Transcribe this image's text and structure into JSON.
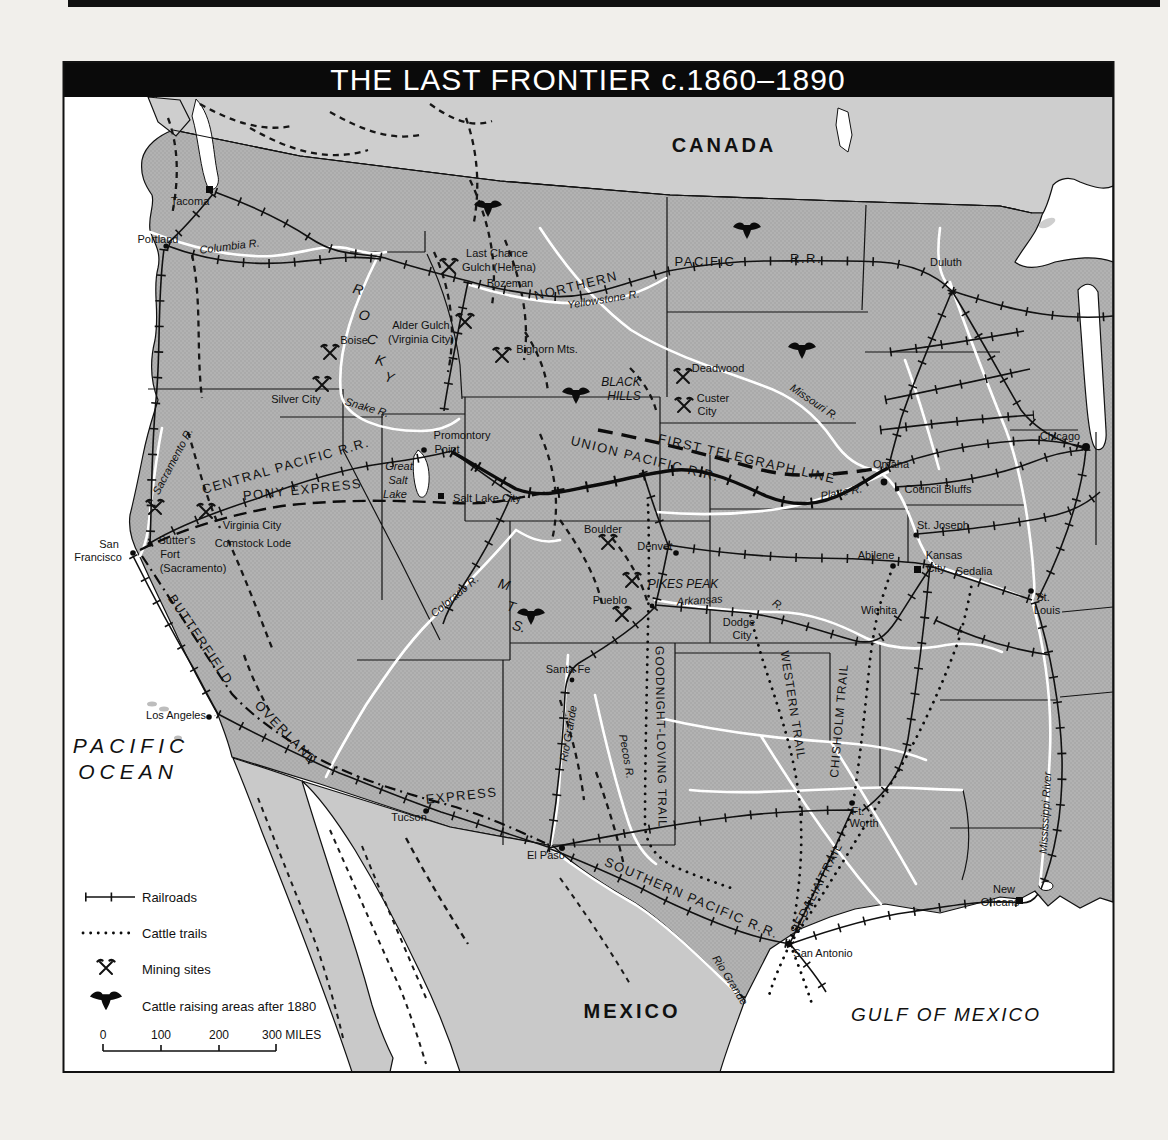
{
  "title": "THE LAST FRONTIER c.1860–1890",
  "regions": {
    "canada": "CANADA",
    "mexico": "MEXICO",
    "pacific_1": "PACIFIC",
    "pacific_2": "OCEAN",
    "gulf": "GULF OF MEXICO"
  },
  "railroads": {
    "northern": "NORTHERN",
    "pacific": "PACIFIC",
    "rr": "R.R.",
    "central_pacific": "CENTRAL PACIFIC R.R.",
    "union_pacific": "UNION PACIFIC R.R.",
    "southern_pacific": "SOUTHERN PACIFIC R.R."
  },
  "routes": {
    "pony_express": "PONY EXPRESS",
    "first_telegraph": "FIRST TELEGRAPH LINE",
    "butterfield": "BUTTERFIELD",
    "overland": "OVERLAND",
    "express": "EXPRESS"
  },
  "trails": {
    "goodnight": "GOODNIGHT-LOVING TRAIL",
    "western": "WESTERN TRAIL",
    "chisholm": "CHISHOLM TRAIL",
    "sedalia": "SEDALIA TRAIL"
  },
  "rivers": {
    "columbia": "Columbia R.",
    "yellowstone": "Yellowstone R.",
    "missouri": "Missouri R.",
    "platte": "Platte R.",
    "snake": "Snake R.",
    "sacramento": "Sacramento R.",
    "colorado": "Colorado R.",
    "arkansas": "Arkansas",
    "arkansas_r": "R.",
    "rio_grande_w": "Rio Grande",
    "pecos": "Pecos R.",
    "rio_grande_s": "Rio Grande",
    "mississippi": "Mississippi River"
  },
  "mountains": {
    "rocky": [
      "R",
      "O",
      "C",
      "K",
      "Y"
    ],
    "mts": [
      "M",
      "T",
      "S."
    ],
    "bighorn": "Bighorn Mts.",
    "black_hills_1": "BLACK",
    "black_hills_2": "HILLS",
    "pikes_peak": "PIKES PEAK",
    "great_salt_1": "Great",
    "great_salt_2": "Salt",
    "great_salt_3": "Lake"
  },
  "cities": {
    "tacoma": "Tacoma",
    "portland": "Portland",
    "duluth": "Duluth",
    "chicago": "Chicago",
    "omaha": "Omaha",
    "council_bluffs": "Council Bluffs",
    "st_joseph": "St. Joseph",
    "kansas_city_1": "Kansas",
    "kansas_city_2": "City",
    "sedalia": "Sedalia",
    "st_louis_1": "St.",
    "st_louis_2": "Louis",
    "abilene": "Abilene",
    "wichita": "Wichita",
    "dodge_1": "Dodge",
    "dodge_2": "City",
    "pueblo": "Pueblo",
    "denver": "Denver",
    "boulder": "Boulder",
    "santa_fe": "Santa Fe",
    "tucson": "Tucson",
    "el_paso": "El Paso",
    "san_antonio": "San Antonio",
    "ft_worth_1": "Ft.",
    "ft_worth_2": "Worth",
    "new_orleans_1": "New",
    "new_orleans_2": "Orleans",
    "los_angeles": "Los Angeles",
    "san_francisco_1": "San",
    "san_francisco_2": "Francisco",
    "salt_lake_city": "Salt Lake City",
    "boise": "Boise",
    "silver_city": "Silver City",
    "bozeman": "Bozeman",
    "last_chance_1": "Last Chance",
    "last_chance_2": "Gulch (Helena)",
    "alder_1": "Alder Gulch",
    "alder_2": "(Virginia City)",
    "deadwood": "Deadwood",
    "custer_1": "Custer",
    "custer_2": "City",
    "virginia_city": "Virginia City",
    "comstock": "Comstock Lode",
    "sutters_1": "Sutter's",
    "sutters_2": "Fort",
    "sutters_3": "(Sacramento)",
    "promontory_1": "Promontory",
    "promontory_2": "Point"
  },
  "legend": {
    "railroads": "Railroads",
    "cattle_trails": "Cattle trails",
    "mining": "Mining sites",
    "cattle_areas": "Cattle raising areas after 1880",
    "scale_0": "0",
    "scale_100": "100",
    "scale_200": "200",
    "scale_300": "300 MILES"
  },
  "icons": {
    "mining": "crossed-hammers-icon",
    "cattle": "longhorn-skull-icon",
    "railroad": "tick-line-symbol",
    "trail": "dotted-line-symbol"
  },
  "colors": {
    "us_land": "#b2b2b2",
    "canada_land": "#cecece",
    "mexico_land": "#c9c9c9",
    "water": "#ffffff",
    "ink": "#111111"
  }
}
